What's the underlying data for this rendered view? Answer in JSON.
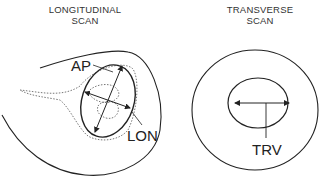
{
  "panels": [
    {
      "title_line1": "LONGITUDINAL",
      "title_line2": "SCAN",
      "labels": {
        "ap": "AP",
        "lon": "LON"
      }
    },
    {
      "title_line1": "TRANSVERSE",
      "title_line2": "SCAN",
      "labels": {
        "trv": "TRV"
      }
    }
  ],
  "colors": {
    "line": "#222222",
    "dotted": "#555555",
    "background": "#ffffff"
  }
}
